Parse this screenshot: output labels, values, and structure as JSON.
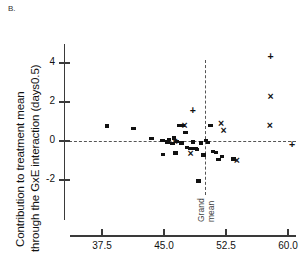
{
  "panel": {
    "label": "B."
  },
  "axis_titles": {
    "y_line1": "Contribution to treatment mean",
    "y_line2": "through the GxE interaction (days0.5)"
  },
  "annotations": {
    "grand_mean_line1": "Grand",
    "grand_mean_line2": "mean"
  },
  "chart_data": {
    "type": "scatter",
    "title": "B.",
    "xlabel": "",
    "ylabel": "Contribution to treatment mean through the GxE interaction (days0.5)",
    "xlim": [
      35.0,
      61.5
    ],
    "ylim": [
      -3.2,
      5.2
    ],
    "xticks": [
      37.5,
      45.0,
      52.5,
      60.0
    ],
    "xtick_labels": [
      "37.5",
      "45.0",
      "52.5",
      "60.0"
    ],
    "yticks": [
      -2,
      0,
      2,
      4
    ],
    "ytick_labels": [
      "-2",
      "0",
      "2",
      "4"
    ],
    "grid": false,
    "legend": "none",
    "reference_lines": [
      {
        "name": "zero-line",
        "orientation": "horizontal",
        "value": 0,
        "style": "dashed"
      },
      {
        "name": "grand-mean-line",
        "orientation": "vertical",
        "value": 50.0,
        "style": "dashed",
        "label": "Grand mean"
      }
    ],
    "series": [
      {
        "name": "square",
        "marker": "square",
        "points": [
          [
            38.1,
            0.77
          ],
          [
            41.3,
            0.62
          ],
          [
            43.5,
            0.12
          ],
          [
            44.8,
            0.02
          ],
          [
            45.4,
            -0.05
          ],
          [
            45.6,
            0.08
          ],
          [
            46.0,
            -0.12
          ],
          [
            46.2,
            0.15
          ],
          [
            46.4,
            -0.62
          ],
          [
            46.9,
            0.8
          ],
          [
            47.3,
            0.8
          ],
          [
            47.6,
            0.45
          ],
          [
            47.8,
            -0.35
          ],
          [
            48.2,
            -0.4
          ],
          [
            48.5,
            -0.05
          ],
          [
            48.8,
            -0.38
          ],
          [
            49.0,
            -0.42
          ],
          [
            49.2,
            -2.05
          ],
          [
            49.5,
            -0.1
          ],
          [
            49.8,
            -0.72
          ],
          [
            50.3,
            -0.08
          ],
          [
            50.6,
            0.78
          ],
          [
            50.9,
            -0.55
          ],
          [
            51.3,
            -0.58
          ],
          [
            51.6,
            -0.95
          ],
          [
            52.0,
            -0.8
          ],
          [
            53.4,
            -0.92
          ],
          [
            44.9,
            -0.7
          ],
          [
            46.6,
            -0.02
          ],
          [
            47.1,
            -0.1
          ],
          [
            50.1,
            0.02
          ]
        ]
      },
      {
        "name": "cross",
        "marker": "x",
        "points": [
          [
            46.3,
            -0.05
          ],
          [
            47.5,
            0.8
          ],
          [
            48.2,
            -0.62
          ],
          [
            51.9,
            0.92
          ],
          [
            52.2,
            0.55
          ],
          [
            53.8,
            -0.98
          ],
          [
            57.8,
            0.8
          ],
          [
            57.9,
            2.3
          ]
        ]
      },
      {
        "name": "plus",
        "marker": "+",
        "points": [
          [
            48.5,
            1.55
          ],
          [
            57.9,
            4.35
          ],
          [
            60.5,
            -0.18
          ]
        ]
      }
    ]
  }
}
